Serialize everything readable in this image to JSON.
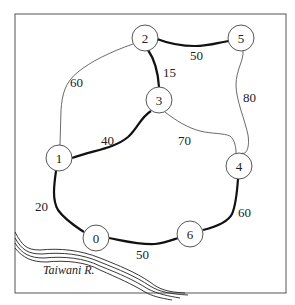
{
  "diagram": {
    "type": "weighted-graph-map",
    "river_label": "Taiwani R.",
    "nodes": [
      {
        "id": "0",
        "label": "0",
        "x": 96,
        "y": 238
      },
      {
        "id": "1",
        "label": "1",
        "x": 59,
        "y": 158
      },
      {
        "id": "2",
        "label": "2",
        "x": 145,
        "y": 38
      },
      {
        "id": "3",
        "label": "3",
        "x": 159,
        "y": 100
      },
      {
        "id": "4",
        "label": "4",
        "x": 239,
        "y": 166
      },
      {
        "id": "5",
        "label": "5",
        "x": 241,
        "y": 38
      },
      {
        "id": "6",
        "label": "6",
        "x": 190,
        "y": 234
      }
    ],
    "edges": [
      {
        "from": "2",
        "to": "5",
        "weight": "50",
        "bold": true
      },
      {
        "from": "2",
        "to": "3",
        "weight": "15",
        "bold": true
      },
      {
        "from": "2",
        "to": "1",
        "weight": "60",
        "bold": false
      },
      {
        "from": "5",
        "to": "4",
        "weight": "80",
        "bold": false
      },
      {
        "from": "3",
        "to": "1",
        "weight": "40",
        "bold": true
      },
      {
        "from": "3",
        "to": "4",
        "weight": "70",
        "bold": false
      },
      {
        "from": "1",
        "to": "0",
        "weight": "20",
        "bold": true
      },
      {
        "from": "0",
        "to": "6",
        "weight": "50",
        "bold": true
      },
      {
        "from": "6",
        "to": "4",
        "weight": "60",
        "bold": true
      }
    ]
  }
}
